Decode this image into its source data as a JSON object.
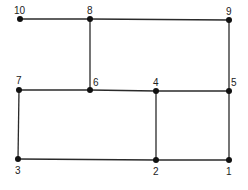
{
  "diagram": {
    "type": "graph",
    "nodes": [
      {
        "id": "1",
        "label": "1",
        "x": 229,
        "y": 160,
        "lx": 226,
        "ly": 175
      },
      {
        "id": "2",
        "label": "2",
        "x": 156,
        "y": 160,
        "lx": 153,
        "ly": 175
      },
      {
        "id": "3",
        "label": "3",
        "x": 18,
        "y": 159,
        "lx": 15,
        "ly": 174
      },
      {
        "id": "4",
        "label": "4",
        "x": 156,
        "y": 91,
        "lx": 153,
        "ly": 86
      },
      {
        "id": "5",
        "label": "5",
        "x": 229,
        "y": 91,
        "lx": 231,
        "ly": 86
      },
      {
        "id": "6",
        "label": "6",
        "x": 90,
        "y": 90,
        "lx": 93,
        "ly": 86
      },
      {
        "id": "7",
        "label": "7",
        "x": 19,
        "y": 90,
        "lx": 16,
        "ly": 84
      },
      {
        "id": "8",
        "label": "8",
        "x": 90,
        "y": 19,
        "lx": 87,
        "ly": 14
      },
      {
        "id": "9",
        "label": "9",
        "x": 229,
        "y": 20,
        "lx": 226,
        "ly": 15
      },
      {
        "id": "10",
        "label": "10",
        "x": 20,
        "y": 19,
        "lx": 14,
        "ly": 14
      }
    ],
    "edges": [
      [
        "10",
        "8"
      ],
      [
        "8",
        "9"
      ],
      [
        "8",
        "6"
      ],
      [
        "9",
        "5"
      ],
      [
        "7",
        "6"
      ],
      [
        "6",
        "4"
      ],
      [
        "4",
        "5"
      ],
      [
        "7",
        "3"
      ],
      [
        "3",
        "2"
      ],
      [
        "2",
        "1"
      ],
      [
        "4",
        "2"
      ],
      [
        "5",
        "1"
      ]
    ]
  }
}
